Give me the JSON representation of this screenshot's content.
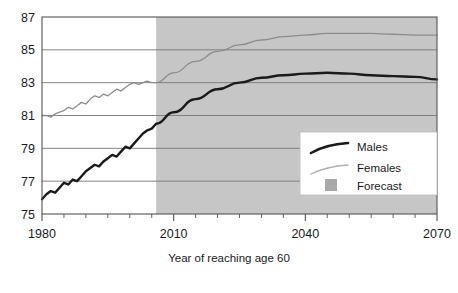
{
  "chart_data": {
    "type": "line",
    "title": "",
    "subtitle": "",
    "xlabel": "Year of reaching age 60",
    "ylabel": "",
    "xlim": [
      1980,
      2070
    ],
    "ylim": [
      75,
      87
    ],
    "x_ticks_major": [
      1980,
      2010,
      2040,
      2070
    ],
    "x_tick_labels": [
      "1980",
      "2010",
      "2040",
      "2070"
    ],
    "x_tick_minor_step": 5,
    "y_ticks": [
      75,
      77,
      79,
      81,
      83,
      85,
      87
    ],
    "y_tick_labels": [
      "75",
      "77",
      "79",
      "81",
      "83",
      "85",
      "87"
    ],
    "grid": "horizontal",
    "legend_position": "bottom-right",
    "legend_entries": [
      "Males",
      "Females",
      "Forecast"
    ],
    "forecast_start_year": 2006,
    "forecast_band_label": "Forecast",
    "colors": {
      "males": "#1a1a1a",
      "females": "#8c8c8c",
      "forecast_band": "#c6c6c6",
      "gridline": "#777777",
      "frame": "#555555",
      "background": "#ffffff"
    },
    "x": [
      1980,
      1981,
      1982,
      1983,
      1984,
      1985,
      1986,
      1987,
      1988,
      1989,
      1990,
      1991,
      1992,
      1993,
      1994,
      1995,
      1996,
      1997,
      1998,
      1999,
      2000,
      2001,
      2002,
      2003,
      2004,
      2005,
      2006,
      2010,
      2015,
      2020,
      2025,
      2030,
      2035,
      2040,
      2045,
      2050,
      2055,
      2060,
      2065,
      2070
    ],
    "series": [
      {
        "name": "Males",
        "values": [
          75.9,
          76.2,
          76.4,
          76.3,
          76.6,
          76.9,
          76.8,
          77.1,
          77.0,
          77.3,
          77.6,
          77.8,
          78.0,
          77.9,
          78.2,
          78.4,
          78.6,
          78.5,
          78.8,
          79.1,
          79.0,
          79.3,
          79.6,
          79.9,
          80.1,
          80.2,
          80.5,
          81.2,
          82.0,
          82.6,
          83.0,
          83.3,
          83.45,
          83.55,
          83.6,
          83.55,
          83.45,
          83.4,
          83.35,
          83.2
        ]
      },
      {
        "name": "Females",
        "values": [
          81.0,
          81.0,
          80.9,
          81.1,
          81.2,
          81.3,
          81.5,
          81.4,
          81.6,
          81.8,
          81.7,
          82.0,
          82.2,
          82.1,
          82.3,
          82.2,
          82.4,
          82.6,
          82.5,
          82.7,
          82.9,
          83.0,
          82.9,
          83.0,
          83.1,
          83.0,
          83.0,
          83.6,
          84.3,
          84.9,
          85.3,
          85.6,
          85.8,
          85.9,
          86.0,
          86.0,
          86.0,
          85.95,
          85.9,
          85.9
        ]
      }
    ]
  },
  "axis": {
    "caption": "Year of reaching age 60"
  },
  "legend": {
    "males_label": "Males",
    "females_label": "Females",
    "forecast_label": "Forecast"
  }
}
